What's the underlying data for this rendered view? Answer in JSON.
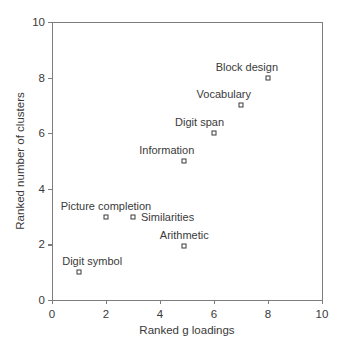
{
  "chart_data": {
    "type": "scatter",
    "title": "",
    "xlabel": "Ranked g loadings",
    "ylabel": "Ranked number of clusters",
    "xlim": [
      0,
      10
    ],
    "ylim": [
      0,
      10
    ],
    "xticks": [
      0,
      2,
      4,
      6,
      8,
      10
    ],
    "yticks": [
      0,
      2,
      4,
      6,
      8,
      10
    ],
    "xtick_labels": [
      "0",
      "2",
      "4",
      "6",
      "8",
      "10"
    ],
    "ytick_labels": [
      "0",
      "2",
      "4",
      "6",
      "8",
      "10"
    ],
    "grid": false,
    "legend": "none",
    "marker": "open-square",
    "marker_color": "#3a3a3a",
    "axis_color": "#7d7d7d",
    "points": [
      {
        "label": "Block design",
        "x": 8.0,
        "y": 8.0,
        "label_pos": "above-left"
      },
      {
        "label": "Vocabulary",
        "x": 7.0,
        "y": 7.0,
        "label_pos": "above-left"
      },
      {
        "label": "Digit span",
        "x": 6.0,
        "y": 6.0,
        "label_pos": "above-left"
      },
      {
        "label": "Information",
        "x": 4.9,
        "y": 5.0,
        "label_pos": "above-left"
      },
      {
        "label": "Picture completion",
        "x": 2.0,
        "y": 3.0,
        "label_pos": "above-center"
      },
      {
        "label": "Similarities",
        "x": 3.0,
        "y": 3.0,
        "label_pos": "right"
      },
      {
        "label": "Arithmetic",
        "x": 4.9,
        "y": 1.95,
        "label_pos": "above-center"
      },
      {
        "label": "Digit symbol",
        "x": 1.0,
        "y": 1.0,
        "label_pos": "above-right"
      }
    ]
  }
}
